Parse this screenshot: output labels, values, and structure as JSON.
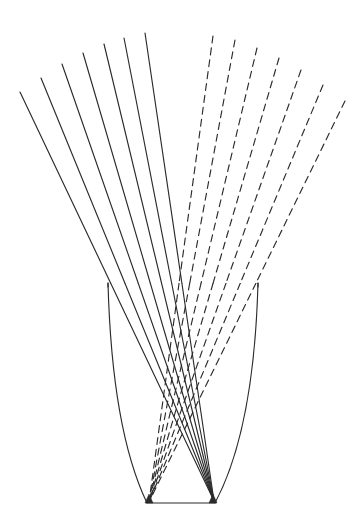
{
  "figure": {
    "canvas": {
      "width": 362,
      "height": 520
    },
    "background_color": "#ffffff",
    "stroke_color": "#2b2b2b",
    "stroke_width": 1.15,
    "dash_pattern": "7 5"
  },
  "chart_data": {
    "type": "line",
    "xlabel": "",
    "ylabel": "",
    "xlim": [
      0,
      362
    ],
    "ylim": [
      0,
      520
    ],
    "grid": false,
    "legend": "none",
    "series": [
      {
        "name": "solid-strands",
        "style": "solid",
        "color": "#2b2b2b",
        "note": "Near-side strands. Each runs from a free upper-left endpoint, down through the vessel wall, converging toward the right base corner.",
        "count": 7,
        "lines": [
          {
            "id": "s1",
            "x1": 20,
            "y1": 92,
            "x2": 214,
            "y2": 501
          },
          {
            "id": "s2",
            "x1": 41,
            "y1": 78,
            "x2": 214,
            "y2": 501
          },
          {
            "id": "s3",
            "x1": 62,
            "y1": 64,
            "x2": 214,
            "y2": 501
          },
          {
            "id": "s4",
            "x1": 83,
            "y1": 53,
            "x2": 214,
            "y2": 501
          },
          {
            "id": "s5",
            "x1": 104,
            "y1": 44,
            "x2": 214,
            "y2": 501
          },
          {
            "id": "s6",
            "x1": 124,
            "y1": 38,
            "x2": 214,
            "y2": 501
          },
          {
            "id": "s7",
            "x1": 145,
            "y1": 33,
            "x2": 214,
            "y2": 501
          }
        ]
      },
      {
        "name": "dashed-strands",
        "style": "dashed",
        "color": "#2b2b2b",
        "note": "Far-side (hidden) strands. Each runs from a free upper-right endpoint, down through the vessel wall, converging toward the left base corner.",
        "count": 7,
        "lines": [
          {
            "id": "d1",
            "x1": 213,
            "y1": 36,
            "x2": 149,
            "y2": 502
          },
          {
            "id": "d2",
            "x1": 235,
            "y1": 40,
            "x2": 149,
            "y2": 502
          },
          {
            "id": "d3",
            "x1": 257,
            "y1": 48,
            "x2": 149,
            "y2": 502
          },
          {
            "id": "d4",
            "x1": 279,
            "y1": 58,
            "x2": 149,
            "y2": 502
          },
          {
            "id": "d5",
            "x1": 301,
            "y1": 70,
            "x2": 149,
            "y2": 502
          },
          {
            "id": "d6",
            "x1": 323,
            "y1": 85,
            "x2": 149,
            "y2": 502
          },
          {
            "id": "d7",
            "x1": 345,
            "y1": 101,
            "x2": 149,
            "y2": 502
          }
        ]
      }
    ],
    "outline": {
      "name": "vessel-outline",
      "rim_y": 283,
      "rim_left_x": 108,
      "rim_right_x": 258,
      "base_y": 503,
      "base_left_x": 147,
      "base_right_x": 215,
      "left_silhouette": {
        "x1": 108,
        "y1": 283,
        "cx": 112,
        "cy": 430,
        "x2": 147,
        "y2": 503
      },
      "right_silhouette": {
        "x1": 258,
        "y1": 283,
        "cx": 254,
        "cy": 430,
        "x2": 215,
        "y2": 503
      }
    }
  }
}
